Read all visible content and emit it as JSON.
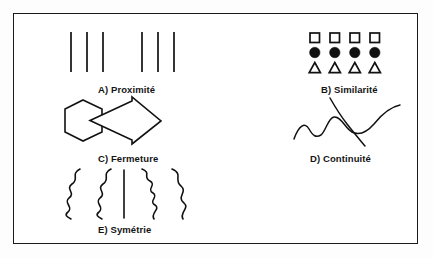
{
  "figure": {
    "border_color": "#1a1a1a",
    "ink_color": "#111111",
    "background_color": "#ffffff",
    "panels": [
      {
        "key": "proximite",
        "letter": "A)",
        "caption": "A) Proximité",
        "name": "Proximité",
        "icon": "vertical-lines-two-groups",
        "groups": 2,
        "lines_per_group": 3,
        "total_lines": 6
      },
      {
        "key": "similarite",
        "letter": "B)",
        "caption": "B) Similarité",
        "name": "Similarité",
        "icon": "shape-rows-grid",
        "rows": [
          {
            "shape": "square",
            "fill": "hollow",
            "count": 4
          },
          {
            "shape": "circle",
            "fill": "solid",
            "count": 4
          },
          {
            "shape": "triangle",
            "fill": "hollow",
            "count": 4
          }
        ]
      },
      {
        "key": "fermeture",
        "letter": "C)",
        "caption": "C) Fermeture",
        "name": "Fermeture",
        "icon": "hexagon-arrow-overlap",
        "shapes": [
          "hexagon",
          "arrow-right"
        ]
      },
      {
        "key": "continuite",
        "letter": "D)",
        "caption": "D) Continuité",
        "name": "Continuité",
        "icon": "crossing-curves",
        "curves": 2
      },
      {
        "key": "symetrie",
        "letter": "E)",
        "caption": "E) Symétrie",
        "name": "Symétrie",
        "icon": "wavy-lines-mirrored",
        "wavy_lines": 4,
        "axis_lines": 1
      }
    ]
  }
}
